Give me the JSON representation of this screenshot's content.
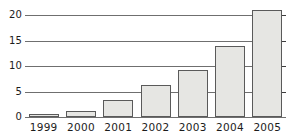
{
  "chart_data": {
    "type": "bar",
    "title": "",
    "subtitle": "",
    "xlabel": "",
    "ylabel": "",
    "categories": [
      "1999",
      "2000",
      "2001",
      "2002",
      "2003",
      "2004",
      "2005"
    ],
    "values": [
      0.5,
      1.2,
      3.3,
      6.2,
      9.3,
      14.0,
      21.0
    ],
    "series": [
      {
        "name": "",
        "values": [
          0.5,
          1.2,
          3.3,
          6.2,
          9.3,
          14.0,
          21.0
        ]
      }
    ],
    "ylim": [
      0,
      22
    ],
    "yticks": [
      0,
      5,
      10,
      15,
      20
    ],
    "ytick_labels": [
      "0",
      "5",
      "10",
      "15",
      "20"
    ],
    "grid": true,
    "grid_axis": "y",
    "legend": false,
    "legend_position": "none",
    "annotations": [],
    "colors": {
      "bar_fill": "#e6e6e3",
      "bar_border": "#5a5a5a",
      "gridline": "#6f6f6f",
      "axis": "#6f6f6f",
      "text": "#1c1c1c",
      "background": "#ffffff"
    }
  }
}
